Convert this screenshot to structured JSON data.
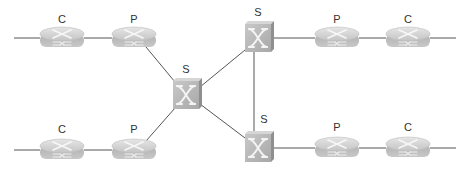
{
  "diagram": {
    "type": "network-topology",
    "colors": {
      "line": "#555555",
      "device_fill": "#b8b8b8",
      "device_light": "#dcdcdc",
      "device_dark": "#9a9a9a",
      "glyph": "#f4f4f4",
      "label": "#333333"
    },
    "nodes": [
      {
        "id": "c1",
        "kind": "router",
        "label": "C",
        "x": 62,
        "y": 38
      },
      {
        "id": "p1",
        "kind": "router",
        "label": "P",
        "x": 134,
        "y": 38
      },
      {
        "id": "c2",
        "kind": "router",
        "label": "C",
        "x": 62,
        "y": 150
      },
      {
        "id": "p2",
        "kind": "router",
        "label": "P",
        "x": 134,
        "y": 150
      },
      {
        "id": "s1",
        "kind": "switch",
        "label": "S",
        "x": 186,
        "y": 95
      },
      {
        "id": "s2",
        "kind": "switch",
        "label": "S",
        "x": 258,
        "y": 38
      },
      {
        "id": "s3",
        "kind": "switch",
        "label": "S",
        "x": 258,
        "y": 148
      },
      {
        "id": "p3",
        "kind": "router",
        "label": "P",
        "x": 337,
        "y": 38
      },
      {
        "id": "c3",
        "kind": "router",
        "label": "C",
        "x": 408,
        "y": 38
      },
      {
        "id": "p4",
        "kind": "router",
        "label": "P",
        "x": 337,
        "y": 148
      },
      {
        "id": "c4",
        "kind": "router",
        "label": "C",
        "x": 408,
        "y": 148
      }
    ],
    "links": [
      [
        "edge-tl",
        "c1"
      ],
      [
        "c1",
        "p1"
      ],
      [
        "p1",
        "s1"
      ],
      [
        "edge-bl",
        "c2"
      ],
      [
        "c2",
        "p2"
      ],
      [
        "p2",
        "s1"
      ],
      [
        "s1",
        "s2"
      ],
      [
        "s1",
        "s3"
      ],
      [
        "s2",
        "s3"
      ],
      [
        "s2",
        "p3"
      ],
      [
        "p3",
        "c3"
      ],
      [
        "c3",
        "edge-tr"
      ],
      [
        "s3",
        "p4"
      ],
      [
        "p4",
        "c4"
      ],
      [
        "c4",
        "edge-br"
      ]
    ]
  }
}
